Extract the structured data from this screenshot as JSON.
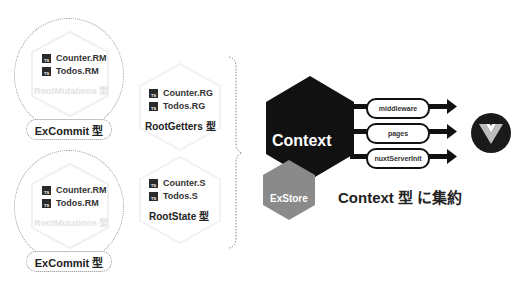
{
  "left_groups": [
    {
      "items": [
        {
          "badge": "TS",
          "label": "Counter.RM"
        },
        {
          "badge": "TS",
          "label": "Todos.RM"
        }
      ],
      "faint_label": "RootMutations 型",
      "pill_label": "ExCommit 型"
    },
    {
      "items": [
        {
          "badge": "TS",
          "label": "Counter.RM"
        },
        {
          "badge": "TS",
          "label": "Todos.RM"
        }
      ],
      "faint_label": "RootMutations 型",
      "pill_label": "ExCommit 型"
    }
  ],
  "middle_groups": [
    {
      "items": [
        {
          "badge": "TS",
          "label": "Counter.RG"
        },
        {
          "badge": "TS",
          "label": "Todos.RG"
        }
      ],
      "type_label": "RootGetters 型"
    },
    {
      "items": [
        {
          "badge": "TS",
          "label": "Counter.S"
        },
        {
          "badge": "TS",
          "label": "Todos.S"
        }
      ],
      "type_label": "RootState 型"
    }
  ],
  "context": {
    "main_label": "Context",
    "sub_label": "ExStore",
    "main_color": "#111111",
    "sub_color": "#8a8a8a",
    "hooks": [
      "middleware",
      "pages",
      "nuxtServerInit"
    ],
    "caption": "Context 型 に集約"
  },
  "logo": {
    "name": "vue-logo"
  }
}
